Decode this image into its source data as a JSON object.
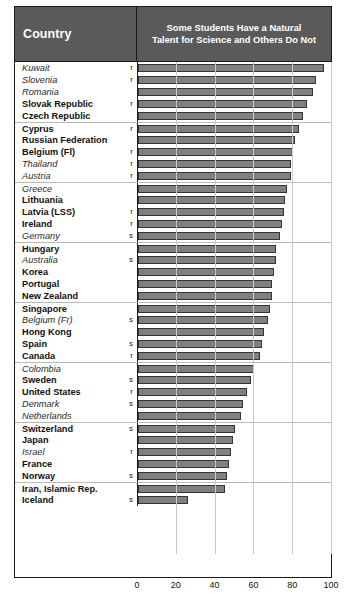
{
  "header": {
    "country_label": "Country",
    "title_line1": "Some Students Have a Natural",
    "title_line2": "Talent for Science and Others Do Not"
  },
  "colors": {
    "header_background": "#5a5a5a",
    "header_text": "#ffffff",
    "bar_fill": "#808080",
    "bar_border": "#333333",
    "frame": "#1a1a1a",
    "gridline": "#c9c9c9",
    "group_separator": "#b9b9b9"
  },
  "chart_data": {
    "type": "bar",
    "orientation": "horizontal",
    "title": "Some Students Have a Natural Talent for Science and Others Do Not",
    "xlabel": "",
    "ylabel": "Country",
    "xlim": [
      0,
      100
    ],
    "xticks": [
      0,
      20,
      40,
      60,
      80,
      100
    ],
    "tick_labels": [
      "0",
      "20",
      "40",
      "60",
      "80",
      "100"
    ],
    "grid": true,
    "grid_axis": "x",
    "legend": null,
    "categories": [
      "Kuwait",
      "Slovenia",
      "Romania",
      "Slovak Republic",
      "Czech Republic",
      "Cyprus",
      "Russian Federation",
      "Belgium (Fl)",
      "Thailand",
      "Austria",
      "Greece",
      "Lithuania",
      "Latvia (LSS)",
      "Ireland",
      "Germany",
      "Hungary",
      "Australia",
      "Korea",
      "Portugal",
      "New Zealand",
      "Singapore",
      "Belgium (Fr)",
      "Hong Kong",
      "Spain",
      "Canada",
      "Colombia",
      "Sweden",
      "United States",
      "Denmark",
      "Netherlands",
      "Switzerland",
      "Japan",
      "Israel",
      "France",
      "Norway",
      "Iran, Islamic Rep.",
      "Iceland"
    ],
    "values": [
      96,
      92,
      90,
      87,
      85,
      83,
      81,
      80,
      79,
      79,
      77,
      76,
      75,
      74,
      73,
      71,
      71,
      70,
      69,
      69,
      68,
      67,
      65,
      64,
      63,
      60,
      58,
      56,
      54,
      53,
      50,
      49,
      48,
      47,
      46,
      45,
      26
    ]
  },
  "rows": [
    {
      "name": "Kuwait",
      "style": "italic",
      "note": "r",
      "value": 96,
      "group_start": false
    },
    {
      "name": "Slovenia",
      "style": "italic",
      "note": "r",
      "value": 92,
      "group_start": false
    },
    {
      "name": "Romania",
      "style": "italic",
      "note": "",
      "value": 90,
      "group_start": false
    },
    {
      "name": "Slovak Republic",
      "style": "bold",
      "note": "r",
      "value": 87,
      "group_start": false
    },
    {
      "name": "Czech Republic",
      "style": "bold",
      "note": "",
      "value": 85,
      "group_start": false
    },
    {
      "name": "Cyprus",
      "style": "bold",
      "note": "r",
      "value": 83,
      "group_start": true
    },
    {
      "name": "Russian Federation",
      "style": "bold",
      "note": "",
      "value": 81,
      "group_start": false
    },
    {
      "name": "Belgium (Fl)",
      "style": "bold",
      "note": "r",
      "value": 80,
      "group_start": false
    },
    {
      "name": "Thailand",
      "style": "italic",
      "note": "r",
      "value": 79,
      "group_start": false
    },
    {
      "name": "Austria",
      "style": "italic",
      "note": "r",
      "value": 79,
      "group_start": false
    },
    {
      "name": "Greece",
      "style": "italic",
      "note": "",
      "value": 77,
      "group_start": true
    },
    {
      "name": "Lithuania",
      "style": "bold",
      "note": "",
      "value": 76,
      "group_start": false
    },
    {
      "name": "Latvia (LSS)",
      "style": "bold",
      "note": "r",
      "value": 75,
      "group_start": false
    },
    {
      "name": "Ireland",
      "style": "bold",
      "note": "r",
      "value": 74,
      "group_start": false
    },
    {
      "name": "Germany",
      "style": "italic",
      "note": "s",
      "value": 73,
      "group_start": false
    },
    {
      "name": "Hungary",
      "style": "bold",
      "note": "",
      "value": 71,
      "group_start": true
    },
    {
      "name": "Australia",
      "style": "italic",
      "note": "s",
      "value": 71,
      "group_start": false
    },
    {
      "name": "Korea",
      "style": "bold",
      "note": "",
      "value": 70,
      "group_start": false
    },
    {
      "name": "Portugal",
      "style": "bold",
      "note": "",
      "value": 69,
      "group_start": false
    },
    {
      "name": "New Zealand",
      "style": "bold",
      "note": "",
      "value": 69,
      "group_start": false
    },
    {
      "name": "Singapore",
      "style": "bold",
      "note": "",
      "value": 68,
      "group_start": true
    },
    {
      "name": "Belgium (Fr)",
      "style": "italic",
      "note": "s",
      "value": 67,
      "group_start": false
    },
    {
      "name": "Hong Kong",
      "style": "bold",
      "note": "",
      "value": 65,
      "group_start": false
    },
    {
      "name": "Spain",
      "style": "bold",
      "note": "s",
      "value": 64,
      "group_start": false
    },
    {
      "name": "Canada",
      "style": "bold",
      "note": "r",
      "value": 63,
      "group_start": false
    },
    {
      "name": "Colombia",
      "style": "italic",
      "note": "",
      "value": 60,
      "group_start": true
    },
    {
      "name": "Sweden",
      "style": "bold",
      "note": "s",
      "value": 58,
      "group_start": false
    },
    {
      "name": "United States",
      "style": "bold",
      "note": "r",
      "value": 56,
      "group_start": false
    },
    {
      "name": "Denmark",
      "style": "italic",
      "note": "s",
      "value": 54,
      "group_start": false
    },
    {
      "name": "Netherlands",
      "style": "italic",
      "note": "",
      "value": 53,
      "group_start": false
    },
    {
      "name": "Switzerland",
      "style": "bold",
      "note": "s",
      "value": 50,
      "group_start": true
    },
    {
      "name": "Japan",
      "style": "bold",
      "note": "",
      "value": 49,
      "group_start": false
    },
    {
      "name": "Israel",
      "style": "italic",
      "note": "r",
      "value": 48,
      "group_start": false
    },
    {
      "name": "France",
      "style": "bold",
      "note": "",
      "value": 47,
      "group_start": false
    },
    {
      "name": "Norway",
      "style": "bold",
      "note": "s",
      "value": 46,
      "group_start": false
    },
    {
      "name": "Iran, Islamic Rep.",
      "style": "bold",
      "note": "",
      "value": 45,
      "group_start": true
    },
    {
      "name": "Iceland",
      "style": "bold",
      "note": "s",
      "value": 26,
      "group_start": false
    }
  ],
  "axis": {
    "ticks": [
      "0",
      "20",
      "40",
      "60",
      "80",
      "100"
    ]
  }
}
